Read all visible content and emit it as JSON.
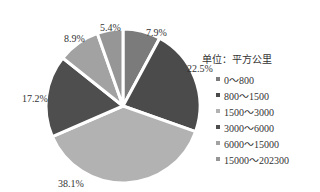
{
  "chart_data": {
    "type": "pie",
    "title": "",
    "unit_label": "单位：平方公里",
    "categories": [
      "0～800",
      "800～1500",
      "1500～3000",
      "3000～6000",
      "6000～15000",
      "15000～202300"
    ],
    "values": [
      7.9,
      22.5,
      38.1,
      17.2,
      8.9,
      5.4
    ],
    "value_labels": [
      "7.9%",
      "22.5%",
      "38.1%",
      "17.2%",
      "8.9%",
      "5.4%"
    ],
    "colors": [
      "#7b7b7b",
      "#4b4b4b",
      "#b2b2b2",
      "#4e4e4e",
      "#a2a2a2",
      "#969696"
    ],
    "legend_position": "right",
    "start_angle_deg": 0,
    "direction": "clockwise"
  },
  "legend": {
    "unit": "单位：平方公里",
    "items": [
      {
        "label": "0～800",
        "color": "#7b7b7b"
      },
      {
        "label": "800～1500",
        "color": "#4b4b4b"
      },
      {
        "label": "1500～3000",
        "color": "#b2b2b2"
      },
      {
        "label": "3000～6000",
        "color": "#4e4e4e"
      },
      {
        "label": "6000～15000",
        "color": "#a2a2a2"
      },
      {
        "label": "15000～202300",
        "color": "#969696"
      }
    ]
  }
}
